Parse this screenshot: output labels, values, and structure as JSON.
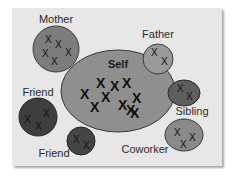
{
  "diagram": {
    "type": "social-network-circles",
    "background_color": "#e7e7e7",
    "nodes": [
      {
        "id": "self",
        "label": "Self",
        "cx": 118,
        "cy": 91,
        "rx": 57,
        "ry": 41,
        "fill": "#8f8f8f",
        "x_count": 10
      },
      {
        "id": "mother",
        "label": "Mother",
        "cx": 56,
        "cy": 49,
        "rx": 23,
        "ry": 23,
        "fill": "#7d7d7d",
        "x_count": 5
      },
      {
        "id": "father",
        "label": "Father",
        "cx": 158,
        "cy": 59,
        "rx": 15,
        "ry": 15,
        "fill": "#9a9a9a",
        "x_count": 2
      },
      {
        "id": "friend1",
        "label": "Friend",
        "cx": 38,
        "cy": 117,
        "rx": 19,
        "ry": 19,
        "fill": "#3e3e3e",
        "x_count": 3
      },
      {
        "id": "friend2",
        "label": "Friend",
        "cx": 81,
        "cy": 141,
        "rx": 14,
        "ry": 14,
        "fill": "#454545",
        "x_count": 2
      },
      {
        "id": "sibling",
        "label": "Sibling",
        "cx": 184,
        "cy": 93,
        "rx": 16,
        "ry": 13,
        "fill": "#5e5e5e",
        "x_count": 2
      },
      {
        "id": "coworker",
        "label": "Coworker",
        "cx": 184,
        "cy": 135,
        "rx": 19,
        "ry": 16,
        "fill": "#8a8a8a",
        "x_count": 3
      }
    ],
    "labels": {
      "self": "Self",
      "mother": "Mother",
      "father": "Father",
      "friend1": "Friend",
      "friend2": "Friend",
      "sibling": "Sibling",
      "coworker": "Coworker"
    },
    "x_mark": "X"
  }
}
